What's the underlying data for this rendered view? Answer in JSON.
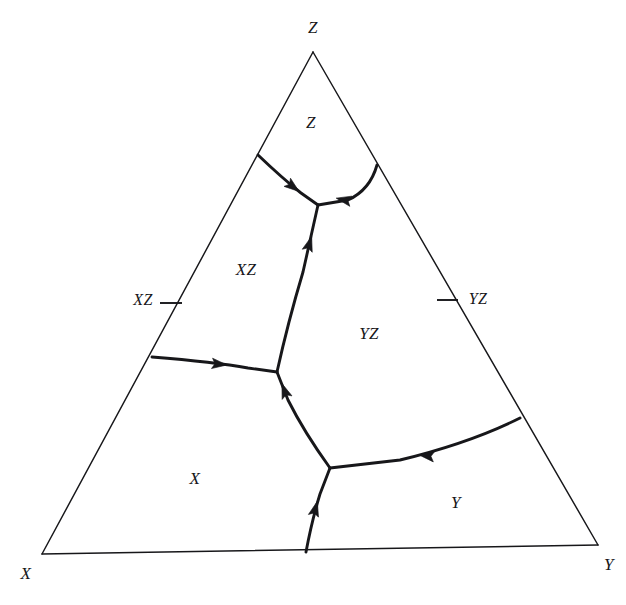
{
  "figure": {
    "type": "ternary-phase-diagram",
    "background_color": "#ffffff",
    "line_color": "#17171a",
    "width": 626,
    "height": 605
  },
  "corners": {
    "apex": {
      "label": "Z",
      "x": 313,
      "y": 52,
      "label_x": 313,
      "label_y": 29
    },
    "left": {
      "label": "X",
      "x": 42,
      "y": 554,
      "label_x": 26,
      "label_y": 575
    },
    "right": {
      "label": "Y",
      "x": 598,
      "y": 545,
      "label_x": 609,
      "label_y": 566
    }
  },
  "edge_ticks": [
    {
      "label": "XZ",
      "edge": "left",
      "tick_x1": 160,
      "tick_y1": 303,
      "tick_x2": 182,
      "tick_y2": 303,
      "label_x": 143,
      "label_y": 301
    },
    {
      "label": "YZ",
      "edge": "right",
      "tick_x1": 437,
      "tick_y1": 300,
      "tick_x2": 458,
      "tick_y2": 300,
      "label_x": 478,
      "label_y": 300
    }
  ],
  "regions": [
    {
      "name": "Z",
      "label": "Z",
      "label_x": 311,
      "label_y": 124
    },
    {
      "name": "XZ",
      "label": "XZ",
      "label_x": 246,
      "label_y": 271
    },
    {
      "name": "YZ",
      "label": "YZ",
      "label_x": 369,
      "label_y": 335
    },
    {
      "name": "X",
      "label": "X",
      "label_x": 195,
      "label_y": 480
    },
    {
      "name": "Y",
      "label": "Y",
      "label_x": 456,
      "label_y": 504
    }
  ],
  "triple_points": [
    {
      "name": "upper-triple-point",
      "x": 318,
      "y": 205
    },
    {
      "name": "middle-triple-point",
      "x": 277,
      "y": 372
    },
    {
      "name": "lower-triple-point",
      "x": 330,
      "y": 468
    }
  ],
  "boundaries": [
    {
      "name": "z-xz-boundary",
      "from": "left-edge",
      "to": "upper-triple-point",
      "path": "M 258,155 Q 282,178 301,193 L 318,205",
      "arrow": {
        "x": 292,
        "y": 186,
        "angle": 38
      }
    },
    {
      "name": "z-yz-boundary",
      "from": "right-edge",
      "to": "upper-triple-point",
      "path": "M 377,165 Q 370,190 348,200 L 318,205",
      "arrow": {
        "x": 345,
        "y": 200,
        "angle": 192
      }
    },
    {
      "name": "xz-yz-boundary",
      "from": "middle-triple-point",
      "to": "upper-triple-point",
      "path": "M 277,372 Q 288,322 303,272 L 318,205",
      "arrow": {
        "x": 309,
        "y": 245,
        "angle": 287
      }
    },
    {
      "name": "x-xz-boundary",
      "from": "left-edge",
      "to": "middle-triple-point",
      "path": "M 152,357 Q 215,362 248,368 L 277,372",
      "arrow": {
        "x": 218,
        "y": 364,
        "angle": 6
      }
    },
    {
      "name": "x-yz-boundary",
      "from": "lower-triple-point",
      "to": "middle-triple-point",
      "path": "M 330,468 Q 304,432 288,400 L 277,372",
      "arrow": {
        "x": 285,
        "y": 392,
        "angle": 250
      }
    },
    {
      "name": "x-y-boundary",
      "from": "bottom-edge",
      "to": "lower-triple-point",
      "path": "M 306,552 Q 312,520 320,494 L 330,468",
      "arrow": {
        "x": 315,
        "y": 510,
        "angle": 285
      }
    },
    {
      "name": "y-yz-boundary",
      "from": "right-edge",
      "to": "lower-triple-point",
      "path": "M 520,418 Q 470,443 400,460 L 330,468",
      "arrow": {
        "x": 428,
        "y": 456,
        "angle": 187
      }
    }
  ]
}
